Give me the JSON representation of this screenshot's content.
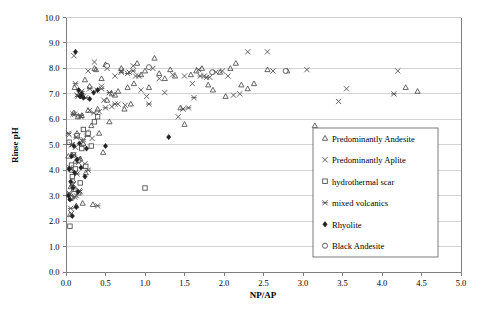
{
  "chart_data": {
    "type": "scatter",
    "title": "",
    "xlabel": "NP/AP",
    "ylabel": "Rinse pH",
    "xlim": [
      0.0,
      5.0
    ],
    "ylim": [
      0.0,
      10.0
    ],
    "xticks": [
      "0.0",
      "0.5",
      "1.0",
      "1.5",
      "2.0",
      "2.5",
      "3.0",
      "3.5",
      "4.0",
      "4.5",
      "5.0"
    ],
    "yticks": [
      "0.0",
      "1.0",
      "2.0",
      "3.0",
      "4.0",
      "5.0",
      "6.0",
      "7.0",
      "8.0",
      "9.0",
      "10.0"
    ],
    "grid": "horizontal",
    "legend_position": "right-lower",
    "series": [
      {
        "name": "Predominantly Andesite",
        "marker": "triangle-open",
        "points": [
          [
            0.03,
            4.55
          ],
          [
            0.05,
            2.25
          ],
          [
            0.06,
            3.35
          ],
          [
            0.07,
            4.0
          ],
          [
            0.08,
            2.95
          ],
          [
            0.09,
            3.6
          ],
          [
            0.1,
            6.25
          ],
          [
            0.11,
            7.25
          ],
          [
            0.12,
            4.35
          ],
          [
            0.13,
            2.6
          ],
          [
            0.14,
            5.45
          ],
          [
            0.15,
            6.1
          ],
          [
            0.16,
            3.1
          ],
          [
            0.17,
            7.0
          ],
          [
            0.18,
            4.45
          ],
          [
            0.2,
            6.15
          ],
          [
            0.21,
            2.7
          ],
          [
            0.22,
            5.05
          ],
          [
            0.24,
            7.55
          ],
          [
            0.25,
            3.9
          ],
          [
            0.27,
            5.4
          ],
          [
            0.28,
            6.35
          ],
          [
            0.3,
            7.3
          ],
          [
            0.32,
            5.75
          ],
          [
            0.34,
            2.65
          ],
          [
            0.36,
            8.0
          ],
          [
            0.38,
            7.95
          ],
          [
            0.4,
            6.4
          ],
          [
            0.42,
            5.45
          ],
          [
            0.45,
            7.6
          ],
          [
            0.47,
            4.7
          ],
          [
            0.5,
            8.15
          ],
          [
            0.52,
            6.75
          ],
          [
            0.55,
            5.9
          ],
          [
            0.58,
            7.0
          ],
          [
            0.62,
            6.95
          ],
          [
            0.66,
            7.1
          ],
          [
            0.7,
            8.0
          ],
          [
            0.74,
            6.4
          ],
          [
            0.78,
            7.25
          ],
          [
            0.82,
            6.6
          ],
          [
            0.86,
            7.4
          ],
          [
            0.9,
            8.2
          ],
          [
            0.95,
            7.75
          ],
          [
            1.0,
            7.9
          ],
          [
            1.05,
            7.25
          ],
          [
            1.12,
            8.4
          ],
          [
            1.18,
            7.8
          ],
          [
            1.25,
            7.6
          ],
          [
            1.32,
            7.95
          ],
          [
            1.38,
            7.7
          ],
          [
            1.45,
            6.45
          ],
          [
            1.5,
            5.8
          ],
          [
            1.58,
            7.75
          ],
          [
            1.65,
            7.9
          ],
          [
            1.72,
            8.0
          ],
          [
            1.8,
            7.35
          ],
          [
            1.86,
            7.15
          ],
          [
            1.95,
            7.85
          ],
          [
            2.02,
            6.9
          ],
          [
            2.08,
            8.0
          ],
          [
            2.15,
            8.2
          ],
          [
            2.22,
            7.35
          ],
          [
            2.3,
            7.2
          ],
          [
            2.38,
            7.4
          ],
          [
            2.55,
            7.95
          ],
          [
            2.8,
            7.9
          ],
          [
            3.15,
            5.75
          ],
          [
            4.3,
            7.25
          ],
          [
            4.45,
            7.1
          ]
        ]
      },
      {
        "name": "Predominantly Aplite",
        "marker": "x-thin",
        "points": [
          [
            0.04,
            5.4
          ],
          [
            0.05,
            3.05
          ],
          [
            0.06,
            4.05
          ],
          [
            0.07,
            2.3
          ],
          [
            0.08,
            5.0
          ],
          [
            0.09,
            3.45
          ],
          [
            0.1,
            8.5
          ],
          [
            0.11,
            6.2
          ],
          [
            0.12,
            4.9
          ],
          [
            0.13,
            3.0
          ],
          [
            0.14,
            6.95
          ],
          [
            0.15,
            5.35
          ],
          [
            0.16,
            4.3
          ],
          [
            0.17,
            7.0
          ],
          [
            0.18,
            3.15
          ],
          [
            0.19,
            6.1
          ],
          [
            0.2,
            5.15
          ],
          [
            0.22,
            6.9
          ],
          [
            0.24,
            4.25
          ],
          [
            0.26,
            5.5
          ],
          [
            0.28,
            7.9
          ],
          [
            0.3,
            6.35
          ],
          [
            0.33,
            5.25
          ],
          [
            0.36,
            8.25
          ],
          [
            0.39,
            7.15
          ],
          [
            0.42,
            6.3
          ],
          [
            0.45,
            7.3
          ],
          [
            0.48,
            6.75
          ],
          [
            0.52,
            8.0
          ],
          [
            0.55,
            7.05
          ],
          [
            0.58,
            6.5
          ],
          [
            0.62,
            7.7
          ],
          [
            0.66,
            6.6
          ],
          [
            0.7,
            7.9
          ],
          [
            0.75,
            6.55
          ],
          [
            0.8,
            7.85
          ],
          [
            0.85,
            8.1
          ],
          [
            0.88,
            7.7
          ],
          [
            0.95,
            7.15
          ],
          [
            1.02,
            6.9
          ],
          [
            1.1,
            8.0
          ],
          [
            1.18,
            7.6
          ],
          [
            1.25,
            7.05
          ],
          [
            1.35,
            7.75
          ],
          [
            1.42,
            6.1
          ],
          [
            1.5,
            7.7
          ],
          [
            1.6,
            7.4
          ],
          [
            1.68,
            7.95
          ],
          [
            1.75,
            7.7
          ],
          [
            1.82,
            7.65
          ],
          [
            1.9,
            7.85
          ],
          [
            1.98,
            7.9
          ],
          [
            2.05,
            7.7
          ],
          [
            2.12,
            6.95
          ],
          [
            2.2,
            7.0
          ],
          [
            2.3,
            8.65
          ],
          [
            2.55,
            8.65
          ],
          [
            2.62,
            7.9
          ],
          [
            3.05,
            7.95
          ],
          [
            3.45,
            6.7
          ],
          [
            3.55,
            7.2
          ],
          [
            4.2,
            7.9
          ]
        ]
      },
      {
        "name": "hydrothermal scar",
        "marker": "square-open",
        "points": [
          [
            0.04,
            5.1
          ],
          [
            0.05,
            1.8
          ],
          [
            0.06,
            2.9
          ],
          [
            0.07,
            4.2
          ],
          [
            0.08,
            3.75
          ],
          [
            0.09,
            4.6
          ],
          [
            0.1,
            3.25
          ],
          [
            0.12,
            4.05
          ],
          [
            0.14,
            5.35
          ],
          [
            0.16,
            4.4
          ],
          [
            0.18,
            3.5
          ],
          [
            0.2,
            4.85
          ],
          [
            0.22,
            5.6
          ],
          [
            0.25,
            4.15
          ],
          [
            0.28,
            5.45
          ],
          [
            0.32,
            4.95
          ],
          [
            0.36,
            5.9
          ],
          [
            0.4,
            6.1
          ],
          [
            1.0,
            3.3
          ]
        ]
      },
      {
        "name": "mixed volcanics",
        "marker": "x-bold",
        "points": [
          [
            0.03,
            5.45
          ],
          [
            0.04,
            3.1
          ],
          [
            0.05,
            4.1
          ],
          [
            0.06,
            2.5
          ],
          [
            0.07,
            5.0
          ],
          [
            0.08,
            3.4
          ],
          [
            0.09,
            6.2
          ],
          [
            0.1,
            4.6
          ],
          [
            0.11,
            2.95
          ],
          [
            0.12,
            7.4
          ],
          [
            0.13,
            5.3
          ],
          [
            0.14,
            3.85
          ],
          [
            0.15,
            6.9
          ],
          [
            0.16,
            4.45
          ],
          [
            0.17,
            3.2
          ],
          [
            0.18,
            6.15
          ],
          [
            0.2,
            7.1
          ],
          [
            0.22,
            5.2
          ],
          [
            0.25,
            6.85
          ],
          [
            0.28,
            4.0
          ],
          [
            0.3,
            7.2
          ],
          [
            0.35,
            6.25
          ],
          [
            0.4,
            2.6
          ],
          [
            0.45,
            7.2
          ],
          [
            0.5,
            6.45
          ],
          [
            0.55,
            7.05
          ],
          [
            0.62,
            6.6
          ],
          [
            0.7,
            7.85
          ],
          [
            0.78,
            7.8
          ],
          [
            0.85,
            7.9
          ],
          [
            0.92,
            7.7
          ],
          [
            1.05,
            6.6
          ],
          [
            1.48,
            6.4
          ],
          [
            1.55,
            6.45
          ],
          [
            1.62,
            6.85
          ],
          [
            1.7,
            7.7
          ],
          [
            1.78,
            7.65
          ],
          [
            4.15,
            7.0
          ]
        ]
      },
      {
        "name": "Rhyolite",
        "marker": "diamond-filled",
        "points": [
          [
            0.03,
            3.0
          ],
          [
            0.04,
            4.05
          ],
          [
            0.05,
            2.85
          ],
          [
            0.06,
            3.55
          ],
          [
            0.07,
            4.55
          ],
          [
            0.08,
            2.2
          ],
          [
            0.09,
            3.3
          ],
          [
            0.1,
            4.95
          ],
          [
            0.11,
            3.9
          ],
          [
            0.12,
            8.65
          ],
          [
            0.13,
            2.55
          ],
          [
            0.14,
            4.4
          ],
          [
            0.15,
            3.15
          ],
          [
            0.16,
            7.15
          ],
          [
            0.17,
            5.05
          ],
          [
            0.18,
            6.9
          ],
          [
            0.19,
            4.1
          ],
          [
            0.2,
            7.0
          ],
          [
            0.22,
            6.85
          ],
          [
            0.24,
            3.75
          ],
          [
            0.26,
            4.85
          ],
          [
            0.3,
            6.8
          ],
          [
            0.35,
            7.05
          ],
          [
            0.4,
            7.15
          ],
          [
            0.5,
            4.95
          ],
          [
            1.3,
            5.3
          ]
        ]
      },
      {
        "name": "Black Andesite",
        "marker": "circle-open",
        "points": [
          [
            0.52,
            8.1
          ],
          [
            1.05,
            8.05
          ],
          [
            1.85,
            7.85
          ],
          [
            2.78,
            7.9
          ]
        ]
      }
    ]
  },
  "legend": {
    "entries": [
      {
        "label": "Predominantly Andesite",
        "marker": "triangle-open"
      },
      {
        "label": "Predominantly Aplite",
        "marker": "x-thin"
      },
      {
        "label": "hydrothermal scar",
        "marker": "square-open"
      },
      {
        "label": "mixed volcanics",
        "marker": "x-bold"
      },
      {
        "label": "Rhyolite",
        "marker": "diamond-filled"
      },
      {
        "label": "Black Andesite",
        "marker": "circle-open"
      }
    ]
  },
  "colors": {
    "marker_stroke": "#4a4a4a",
    "marker_fill": "#222222",
    "grid": "#c9c9c9",
    "axis": "#7f7f7f",
    "background": "#ffffff"
  }
}
